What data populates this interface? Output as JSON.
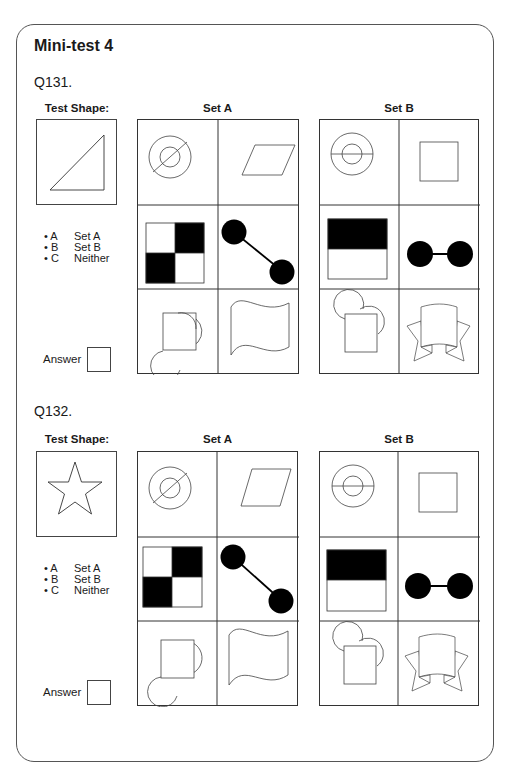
{
  "title": "Mini-test 4",
  "questions": [
    {
      "label": "Q131.",
      "test_shape_heading": "Test Shape:",
      "test_shape": "right-triangle",
      "set_a_heading": "Set A",
      "set_b_heading": "Set B",
      "options": [
        {
          "key": "• A",
          "value": "Set A"
        },
        {
          "key": "• B",
          "value": "Set B"
        },
        {
          "key": "• C",
          "value": "Neither"
        }
      ],
      "answer_label": "Answer",
      "answer_value": ""
    },
    {
      "label": "Q132.",
      "test_shape_heading": "Test Shape:",
      "test_shape": "five-point-star",
      "set_a_heading": "Set A",
      "set_b_heading": "Set B",
      "options": [
        {
          "key": "• A",
          "value": "Set A"
        },
        {
          "key": "• B",
          "value": "Set B"
        },
        {
          "key": "• C",
          "value": "Neither"
        }
      ],
      "answer_label": "Answer",
      "answer_value": ""
    }
  ],
  "set_a_cells": [
    "concentric-circles-diagonal-line",
    "parallelogram",
    "checkerboard-2x2",
    "two-black-circles-diagonal-link",
    "square-two-circles-diagonal",
    "wavy-flag"
  ],
  "set_b_cells": [
    "concentric-circles-horizontal-line",
    "square",
    "half-black-rectangle",
    "two-black-circles-horizontal-link",
    "square-two-circles-top",
    "ribbon-banner"
  ]
}
